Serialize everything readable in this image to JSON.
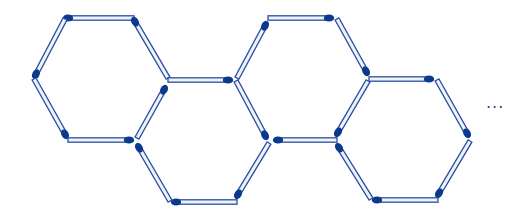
{
  "figure": {
    "continuation_symbol": "···",
    "colors": {
      "stick_outline": "#2c4fa0",
      "stick_fill": "#eef3fb",
      "head": "#0b3a8c",
      "background": "#ffffff"
    },
    "hexagon_count_shown": 4,
    "matchstick_count_shown": 21
  },
  "sticks": [
    {
      "head": [
        66,
        18
      ],
      "tail": [
        134,
        18
      ]
    },
    {
      "head": [
        134,
        20
      ],
      "tail": [
        168,
        78
      ]
    },
    {
      "head": [
        35,
        76
      ],
      "tail": [
        65,
        19
      ]
    },
    {
      "head": [
        66,
        136
      ],
      "tail": [
        34,
        79
      ]
    },
    {
      "head": [
        131,
        140
      ],
      "tail": [
        68,
        140
      ]
    },
    {
      "head": [
        165,
        88
      ],
      "tail": [
        137,
        138
      ]
    },
    {
      "head": [
        230,
        80
      ],
      "tail": [
        168,
        80
      ]
    },
    {
      "head": [
        266,
        137
      ],
      "tail": [
        236,
        81
      ]
    },
    {
      "head": [
        237,
        196
      ],
      "tail": [
        269,
        143
      ]
    },
    {
      "head": [
        174,
        202
      ],
      "tail": [
        237,
        202
      ]
    },
    {
      "head": [
        138,
        146
      ],
      "tail": [
        170,
        201
      ]
    },
    {
      "head": [
        266,
        24
      ],
      "tail": [
        237,
        78
      ]
    },
    {
      "head": [
        331,
        18
      ],
      "tail": [
        268,
        18
      ]
    },
    {
      "head": [
        367,
        73
      ],
      "tail": [
        337,
        19
      ]
    },
    {
      "head": [
        276,
        140
      ],
      "tail": [
        337,
        140
      ]
    },
    {
      "head": [
        337,
        134
      ],
      "tail": [
        368,
        81
      ]
    },
    {
      "head": [
        431,
        79
      ],
      "tail": [
        369,
        79
      ]
    },
    {
      "head": [
        468,
        135
      ],
      "tail": [
        437,
        80
      ]
    },
    {
      "head": [
        438,
        195
      ],
      "tail": [
        470,
        141
      ]
    },
    {
      "head": [
        375,
        200
      ],
      "tail": [
        438,
        200
      ]
    },
    {
      "head": [
        338,
        146
      ],
      "tail": [
        371,
        199
      ]
    }
  ]
}
